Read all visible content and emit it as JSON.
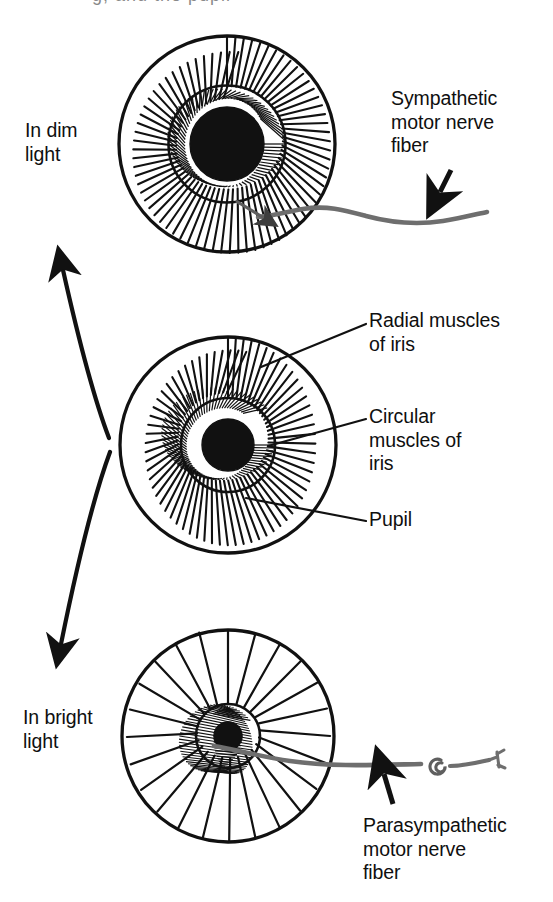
{
  "figure": {
    "cropped_top_text": "g, and the pupil",
    "background_color": "#ffffff",
    "ink_color": "#111111",
    "nerve_color": "#6e6e6e"
  },
  "labels": {
    "dim_light": "In dim\nlight",
    "bright_light": "In bright\nlight",
    "sympathetic": "Sympathetic\nmotor nerve\nfiber",
    "parasympathetic": "Parasympathetic\nmotor nerve\nfiber",
    "radial_muscles": "Radial muscles\nof iris",
    "circular_muscles": "Circular\nmuscles of\niris",
    "pupil": "Pupil"
  },
  "eyes": [
    {
      "id": "eye-dim-light",
      "state": "dilated",
      "caption": "In dim light",
      "center_x": 227,
      "center_y": 144,
      "iris_radius": 108,
      "collarette_radius": 58,
      "pupil_radius": 37,
      "radial_line_count": 50,
      "circular_line_count": 76,
      "nerve": "sympathetic"
    },
    {
      "id": "eye-neutral",
      "state": "intermediate",
      "caption": "",
      "center_x": 228,
      "center_y": 445,
      "iris_radius": 108,
      "collarette_radius": 47,
      "pupil_radius": 26,
      "radial_line_count": 56,
      "circular_line_count": 72,
      "nerve": "none"
    },
    {
      "id": "eye-bright-light",
      "state": "constricted",
      "caption": "In bright light",
      "center_x": 228,
      "center_y": 736,
      "iris_radius": 106,
      "collarette_radius": 32,
      "pupil_radius": 14,
      "radial_line_count": 24,
      "circular_line_count": 60,
      "nerve": "parasympathetic"
    }
  ],
  "nerves": [
    {
      "id": "sympathetic-motor-nerve-fiber",
      "label": "Sympathetic motor nerve fiber",
      "enters_eye": "eye-dim-light",
      "has_ganglion": false,
      "has_terminal_branch": false
    },
    {
      "id": "parasympathetic-motor-nerve-fiber",
      "label": "Parasympathetic motor nerve fiber",
      "enters_eye": "eye-bright-light",
      "has_ganglion": true,
      "has_terminal_branch": true
    }
  ],
  "arrows": [
    {
      "id": "arrow-to-dim",
      "direction": "up-left",
      "from_eye": "eye-neutral",
      "to_eye": "eye-dim-light"
    },
    {
      "id": "arrow-to-bright",
      "direction": "down-left",
      "from_eye": "eye-neutral",
      "to_eye": "eye-bright-light"
    },
    {
      "id": "arrow-sympathetic-pointer",
      "direction": "down-left",
      "points_at": "sympathetic-motor-nerve-fiber"
    },
    {
      "id": "arrow-parasympathetic-pointer",
      "direction": "up",
      "points_at": "parasympathetic-motor-nerve-fiber"
    }
  ]
}
